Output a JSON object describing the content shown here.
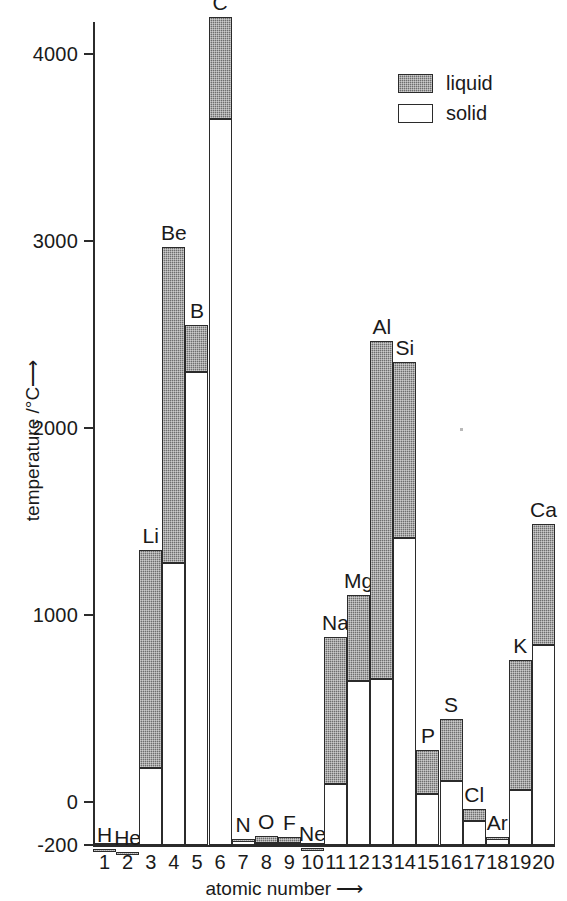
{
  "chart_data": {
    "type": "bar",
    "title": "",
    "subtitle": "",
    "xlabel": "atomic number",
    "ylabel": "temperature /°C",
    "xlabel_arrow": "⟶",
    "ylabel_arrow": "⟶",
    "ylim": [
      -200,
      4250
    ],
    "xlim": [
      0.5,
      20.5
    ],
    "grid": false,
    "stacked": true,
    "legend_position": "top-right",
    "y_ticks": [
      -200,
      0,
      1000,
      2000,
      3000,
      4000
    ],
    "y_tick_labels": [
      "-200",
      "0",
      "1000",
      "2000",
      "3000",
      "4000"
    ],
    "x_ticks": [
      1,
      2,
      3,
      4,
      5,
      6,
      7,
      8,
      9,
      10,
      11,
      12,
      13,
      14,
      15,
      16,
      17,
      18,
      19,
      20
    ],
    "x_tick_labels": [
      "1",
      "2",
      "3",
      "4",
      "5",
      "6",
      "7",
      "8",
      "9",
      "10",
      "11",
      "12",
      "13",
      "14",
      "15",
      "16",
      "17",
      "18",
      "19",
      "20"
    ],
    "baseline": -200,
    "categories": [
      "H",
      "He",
      "Li",
      "Be",
      "B",
      "C",
      "N",
      "O",
      "F",
      "Ne",
      "Na",
      "Mg",
      "Al",
      "Si",
      "P",
      "S",
      "Cl",
      "Ar",
      "K",
      "Ca"
    ],
    "series": [
      {
        "name": "solid",
        "description": "bar spans baseline up to the melting point",
        "values": [
          -259,
          -272,
          181,
          1278,
          2300,
          3652,
          -210,
          -219,
          -220,
          -249,
          98,
          649,
          660,
          1410,
          44,
          113,
          -101,
          -189,
          63,
          839
        ]
      },
      {
        "name": "liquid",
        "description": "bar spans melting point up to the boiling point",
        "values": [
          -253,
          -269,
          1347,
          2970,
          2550,
          4200,
          -196,
          -183,
          -188,
          -246,
          883,
          1107,
          2467,
          2355,
          280,
          445,
          -35,
          -186,
          760,
          1484
        ]
      }
    ],
    "bars": [
      {
        "label": "H",
        "z": 1,
        "melting": -259,
        "boiling": -253
      },
      {
        "label": "He",
        "z": 2,
        "melting": -272,
        "boiling": -269
      },
      {
        "label": "Li",
        "z": 3,
        "melting": 181,
        "boiling": 1347
      },
      {
        "label": "Be",
        "z": 4,
        "melting": 1278,
        "boiling": 2970
      },
      {
        "label": "B",
        "z": 5,
        "melting": 2300,
        "boiling": 2550
      },
      {
        "label": "C",
        "z": 6,
        "melting": 3652,
        "boiling": 4200
      },
      {
        "label": "N",
        "z": 7,
        "melting": -210,
        "boiling": -196
      },
      {
        "label": "O",
        "z": 8,
        "melting": -219,
        "boiling": -183
      },
      {
        "label": "F",
        "z": 9,
        "melting": -220,
        "boiling": -188
      },
      {
        "label": "Ne",
        "z": 10,
        "melting": -249,
        "boiling": -246
      },
      {
        "label": "Na",
        "z": 11,
        "melting": 98,
        "boiling": 883
      },
      {
        "label": "Mg",
        "z": 12,
        "melting": 649,
        "boiling": 1107
      },
      {
        "label": "Al",
        "z": 13,
        "melting": 660,
        "boiling": 2467
      },
      {
        "label": "Si",
        "z": 14,
        "melting": 1410,
        "boiling": 2355
      },
      {
        "label": "P",
        "z": 15,
        "melting": 44,
        "boiling": 280
      },
      {
        "label": "S",
        "z": 16,
        "melting": 113,
        "boiling": 445
      },
      {
        "label": "Cl",
        "z": 17,
        "melting": -101,
        "boiling": -35
      },
      {
        "label": "Ar",
        "z": 18,
        "melting": -189,
        "boiling": -186
      },
      {
        "label": "K",
        "z": 19,
        "melting": 63,
        "boiling": 760
      },
      {
        "label": "Ca",
        "z": 20,
        "melting": 839,
        "boiling": 1484
      }
    ],
    "legend": [
      {
        "key": "liquid",
        "label": "liquid",
        "swatch": "hatched-gray",
        "color": "#6e6e6e"
      },
      {
        "key": "solid",
        "label": "solid",
        "swatch": "white-outline",
        "color": "#ffffff"
      }
    ],
    "colors": {
      "axis": "#2b2b2b",
      "text": "#1a1a1a",
      "liquid": "#6e6e6e",
      "solid": "#ffffff",
      "background": "#ffffff"
    }
  }
}
